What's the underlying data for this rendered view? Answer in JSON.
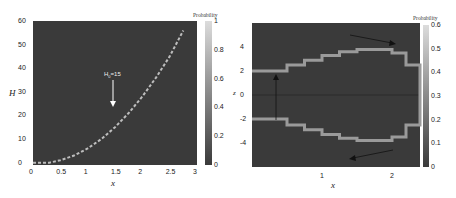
{
  "chart_data": [
    {
      "type": "heatmap",
      "title": "",
      "xlabel": "x",
      "ylabel": "H",
      "xlim": [
        0,
        3
      ],
      "ylim": [
        -1,
        60
      ],
      "x_ticks": [
        "0",
        "0.5",
        "1",
        "1.5",
        "2",
        "2.5",
        "3"
      ],
      "y_ticks": [
        "0",
        "10",
        "20",
        "30",
        "40",
        "50",
        "60"
      ],
      "colorbar": {
        "title": "Probability",
        "range": [
          0,
          1
        ],
        "ticks": [
          "0",
          "0.2",
          "0.4",
          "0.6",
          "0.8",
          "1"
        ]
      },
      "annotation": {
        "text": "H_0=15",
        "arrow": "down",
        "x": 1.5,
        "y_from": 34,
        "y_to": 24
      },
      "series": [
        {
          "name": "probability ridge",
          "x": [
            0,
            0.3,
            0.5,
            0.75,
            1.0,
            1.25,
            1.5,
            1.75,
            2.0,
            2.25,
            2.5,
            2.75
          ],
          "y": [
            0,
            0,
            1,
            3,
            6,
            10,
            15,
            21,
            28,
            36,
            45,
            56
          ]
        }
      ],
      "grid": false
    },
    {
      "type": "heatmap",
      "title": "",
      "xlabel": "x",
      "ylabel": "z",
      "xlim": [
        0,
        2.4
      ],
      "ylim": [
        -6,
        6
      ],
      "x_ticks": [
        "1",
        "2"
      ],
      "y_ticks": [
        "-4",
        "-2",
        "0",
        "2",
        "4"
      ],
      "colorbar": {
        "title": "Probability",
        "range": [
          0,
          0.6
        ],
        "ticks": [
          "0",
          "0.1",
          "0.2",
          "0.3",
          "0.4",
          "0.5",
          "0.6"
        ]
      },
      "annotations": [
        {
          "type": "arrow",
          "direction": "up",
          "x": 0.35,
          "y_from": -2,
          "y_to": 2
        },
        {
          "type": "arrow",
          "direction": "right-down",
          "from": [
            1.4,
            5
          ],
          "to": [
            2.1,
            4
          ]
        },
        {
          "type": "arrow",
          "direction": "left-down",
          "from": [
            2.1,
            -4.6
          ],
          "to": [
            1.4,
            -5.3
          ]
        }
      ],
      "series": [
        {
          "name": "upper branch",
          "x": [
            0,
            0.3,
            0.5,
            0.75,
            1.0,
            1.25,
            1.5,
            1.75,
            2.0,
            2.2,
            2.4
          ],
          "y": [
            2,
            2,
            2.5,
            2.9,
            3.3,
            3.6,
            3.8,
            3.8,
            3.5,
            2.5,
            0
          ]
        },
        {
          "name": "lower branch",
          "x": [
            0,
            0.3,
            0.5,
            0.75,
            1.0,
            1.25,
            1.5,
            1.75,
            2.0,
            2.2,
            2.4
          ],
          "y": [
            -2,
            -2,
            -2.5,
            -2.9,
            -3.3,
            -3.6,
            -3.8,
            -3.8,
            -3.5,
            -2.5,
            0
          ]
        }
      ],
      "grid": false
    }
  ]
}
